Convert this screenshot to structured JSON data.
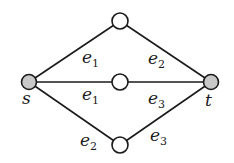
{
  "diagram": {
    "type": "graph",
    "colors": {
      "terminal_fill": "#c8c8c8",
      "inner_fill": "#ffffff",
      "stroke": "#1a1a1a"
    },
    "nodes": [
      {
        "id": "s",
        "label": "s",
        "x": 29,
        "y": 82,
        "terminal": true,
        "label_x": 22,
        "label_y": 104
      },
      {
        "id": "t",
        "label": "t",
        "x": 211,
        "y": 82,
        "terminal": true,
        "label_x": 205,
        "label_y": 106
      },
      {
        "id": "top",
        "label": "",
        "x": 120,
        "y": 21,
        "terminal": false
      },
      {
        "id": "mid",
        "label": "",
        "x": 120,
        "y": 82,
        "terminal": false
      },
      {
        "id": "bot",
        "label": "",
        "x": 120,
        "y": 145,
        "terminal": false
      }
    ],
    "edges": [
      {
        "from": "s",
        "to": "top",
        "label_base": "e",
        "label_sub": "1",
        "lx": 82,
        "ly": 63
      },
      {
        "from": "top",
        "to": "t",
        "label_base": "e",
        "label_sub": "2",
        "lx": 148,
        "ly": 64
      },
      {
        "from": "s",
        "to": "mid",
        "label_base": "e",
        "label_sub": "1",
        "lx": 82,
        "ly": 100
      },
      {
        "from": "mid",
        "to": "t",
        "label_base": "e",
        "label_sub": "3",
        "lx": 148,
        "ly": 104
      },
      {
        "from": "s",
        "to": "bot",
        "label_base": "e",
        "label_sub": "2",
        "lx": 80,
        "ly": 146
      },
      {
        "from": "bot",
        "to": "t",
        "label_base": "e",
        "label_sub": "3",
        "lx": 150,
        "ly": 141
      }
    ]
  }
}
